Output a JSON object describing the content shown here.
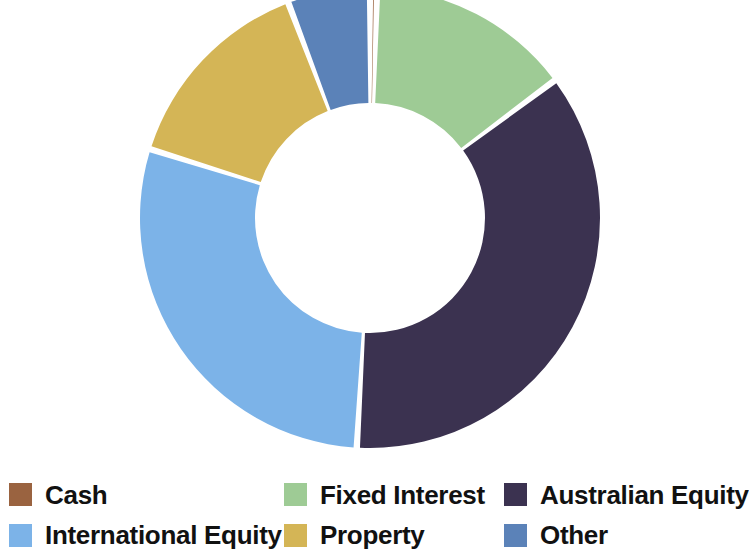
{
  "chart_data": {
    "type": "pie",
    "variant": "donut",
    "title": "",
    "subtitle": "",
    "xlabel": "",
    "ylabel": "",
    "grid": false,
    "legend_position": "bottom",
    "legend_columns": 3,
    "units": "percent",
    "start_angle_deg": 0,
    "direction": "clockwise",
    "center_x": 370,
    "center_y": 218,
    "outer_radius": 230,
    "inner_radius": 115,
    "gap_deg": 1.6,
    "categories": [
      "Cash",
      "Fixed Interest",
      "Australian Equity",
      "International Equity",
      "Property",
      "Other"
    ],
    "values": [
      0.5,
      14.3,
      36.1,
      28.9,
      14.4,
      5.8
    ],
    "colors": [
      "#9a6340",
      "#9ecb95",
      "#3b3250",
      "#7cb3e8",
      "#d4b556",
      "#5b82b8"
    ],
    "slices": [
      {
        "label": "Cash",
        "value": 0.5,
        "color": "#9a6340",
        "start_deg": 0.0,
        "end_deg": 1.8
      },
      {
        "label": "Fixed Interest",
        "value": 14.3,
        "color": "#9ecb95",
        "start_deg": 1.8,
        "end_deg": 53.3
      },
      {
        "label": "Australian Equity",
        "value": 36.1,
        "color": "#3b3250",
        "start_deg": 53.3,
        "end_deg": 183.3
      },
      {
        "label": "International Equity",
        "value": 28.9,
        "color": "#7cb3e8",
        "start_deg": 183.3,
        "end_deg": 287.4
      },
      {
        "label": "Property",
        "value": 14.4,
        "color": "#d4b556",
        "start_deg": 287.4,
        "end_deg": 339.2
      },
      {
        "label": "Other",
        "value": 5.8,
        "color": "#5b82b8",
        "start_deg": 339.2,
        "end_deg": 360.0
      }
    ]
  },
  "legend": {
    "entries": [
      {
        "label": "Cash",
        "color": "#9a6340",
        "column": 1,
        "row": 1
      },
      {
        "label": "International Equity",
        "color": "#7cb3e8",
        "column": 1,
        "row": 2
      },
      {
        "label": "Fixed Interest",
        "color": "#9ecb95",
        "column": 2,
        "row": 1
      },
      {
        "label": "Property",
        "color": "#d4b556",
        "column": 2,
        "row": 2
      },
      {
        "label": "Australian Equity",
        "color": "#3b3250",
        "column": 3,
        "row": 1
      },
      {
        "label": "Other",
        "color": "#5b82b8",
        "column": 3,
        "row": 2
      }
    ]
  },
  "canvas": {
    "background": "#ffffff",
    "width": 746,
    "height": 555
  }
}
